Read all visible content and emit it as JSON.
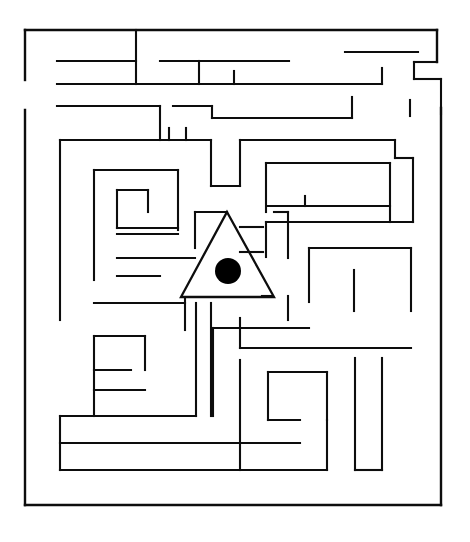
{
  "puzzle": {
    "title": "Maze Puzzle",
    "type": "rectangular-maze",
    "background_color": "#ffffff",
    "wall_color": "#0d0d0d",
    "wall_thickness": 2.1,
    "canvas": {
      "width": 470,
      "height": 542
    }
  },
  "markers": {
    "goal_triangle": {
      "name": "triangle-outline",
      "points": "227,212 274,297 181,297",
      "stroke_color": "#0d0d0d"
    },
    "goal_dot": {
      "name": "filled-circle",
      "cx": 228,
      "cy": 271,
      "r": 13,
      "fill_color": "#000000"
    }
  },
  "walls": {
    "border": [
      "M 25,30 L 25,80",
      "M 25,30 L 437,30",
      "M 437,30 L 437,62",
      "M 25,110 L 25,505",
      "M 25,505 L 441,505",
      "M 441,108 L 441,505"
    ],
    "segments": [
      "M 136,30 L 136,84",
      "M 57,61 L 136,61",
      "M 160,61 L 289,61",
      "M 345,52 L 418,52",
      "M 199,61 L 199,84",
      "M 57,84 L 234,84",
      "M 234,84 L 234,71",
      "M 232,84 L 382,84",
      "M 382,84 L 382,68",
      "M 437,62 L 414,62",
      "M 414,62 L 414,79",
      "M 414,79 L 441,79",
      "M 441,79 L 441,114",
      "M 57,106 L 160,106",
      "M 160,106 L 160,140",
      "M 173,106 L 212,106",
      "M 212,106 L 212,118",
      "M 212,118 L 352,118",
      "M 352,118 L 352,97",
      "M 410,100 L 410,116",
      "M 60,140 L 60,320",
      "M 60,140 L 211,140",
      "M 211,140 L 211,186",
      "M 211,186 L 240,186",
      "M 240,186 L 240,140",
      "M 240,140 L 395,140",
      "M 395,140 L 395,158",
      "M 395,158 L 413,158",
      "M 413,158 L 413,222",
      "M 169,140 L 169,128",
      "M 186,140 L 186,128",
      "M 94,170 L 94,280",
      "M 94,170 L 178,170",
      "M 178,170 L 178,230",
      "M 117,190 L 117,228",
      "M 117,190 L 148,190",
      "M 148,190 L 148,212",
      "M 117,228 L 178,228",
      "M 117,234 L 178,234",
      "M 266,163 L 266,212",
      "M 266,163 L 390,163",
      "M 390,163 L 390,222",
      "M 268,206 L 390,206",
      "M 305,196 L 305,206",
      "M 266,222 L 413,222",
      "M 266,222 L 266,257",
      "M 195,212 L 227,212",
      "M 195,212 L 195,248",
      "M 274,212 L 288,212",
      "M 288,212 L 288,258",
      "M 240,227 L 263,227",
      "M 240,252 L 263,252",
      "M 117,258 L 195,258",
      "M 117,276 L 160,276",
      "M 309,248 L 309,302",
      "M 309,248 L 411,248",
      "M 411,248 L 411,311",
      "M 354,270 L 354,311",
      "M 262,296 L 271,296",
      "M 237,297 L 270,297",
      "M 185,298 L 185,330",
      "M 94,303 L 185,303",
      "M 196,303 L 196,416",
      "M 211,303 L 211,416",
      "M 213,328 L 309,328",
      "M 288,296 L 288,320",
      "M 240,318 L 240,348",
      "M 213,328 L 213,416",
      "M 240,348 L 411,348",
      "M 94,336 L 145,336",
      "M 145,336 L 145,370",
      "M 94,336 L 94,416",
      "M 94,370 L 131,370",
      "M 240,360 L 240,470",
      "M 268,372 L 268,420",
      "M 268,372 L 327,372",
      "M 327,372 L 327,420",
      "M 268,420 L 300,420",
      "M 355,358 L 355,470",
      "M 382,358 L 382,470",
      "M 355,470 L 382,470",
      "M 60,416 L 196,416",
      "M 60,416 L 60,470",
      "M 60,443 L 300,443",
      "M 60,470 L 327,470",
      "M 327,420 L 327,470",
      "M 94,390 L 145,390"
    ]
  }
}
